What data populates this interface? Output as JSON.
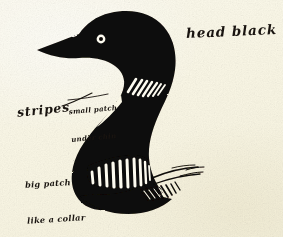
{
  "image": {
    "subject": "common-loon-head-and-neck",
    "medium": "ink-brush-field-sketch",
    "width": 283,
    "height": 237
  },
  "colors": {
    "paper": "#fbf8e9",
    "paper_warm": "#f6f2de",
    "ink": "#0d0a08",
    "ink_soft": "#191410",
    "highlight": "#fdfbf0"
  },
  "annotations": [
    {
      "id": "head-black",
      "text": "head black",
      "x": 186,
      "y": 24,
      "size": 13.5,
      "rotation": -2.6,
      "has_leader": false
    },
    {
      "id": "stripes",
      "text": "stripes",
      "x": 17,
      "y": 103,
      "size": 12.5,
      "rotation": -6,
      "has_leader": true
    },
    {
      "id": "small-patch-under-chin",
      "line1": "small patch",
      "line2": "under chin",
      "x": 70,
      "y": 87,
      "size": 7,
      "rotation": -5,
      "has_leader": true
    },
    {
      "id": "big-patch-like-a-collar",
      "line1": "big patch",
      "line2": "like a collar",
      "x": 26,
      "y": 152,
      "size": 8.2,
      "rotation": -3.5,
      "has_leader": false
    }
  ],
  "features": {
    "eye": {
      "cx": 101,
      "cy": 39,
      "ring_r": 4.4,
      "pupil_r": 2.0,
      "ring_color": "#fdfbf0"
    },
    "upper_patch": {
      "name": "small-patch-under-chin",
      "stripe_count": 7,
      "orientation": "diagonal"
    },
    "collar_patch": {
      "name": "big-patch-like-a-collar",
      "stripe_count": 10,
      "orientation": "vertical"
    },
    "back_feathers": {
      "name": "feather-barb-hatching",
      "stroke_count": 14
    },
    "bill": {
      "tip_x": 37,
      "tip_y": 50,
      "length": 60,
      "shape": "long-dagger"
    }
  }
}
